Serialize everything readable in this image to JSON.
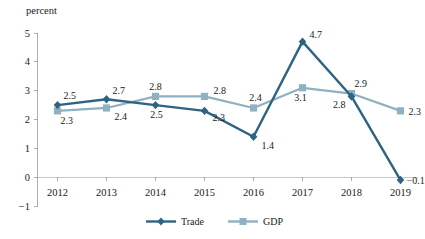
{
  "chart_data": {
    "type": "line",
    "title": "",
    "xlabel": "",
    "ylabel": "percent",
    "ylim": [
      -1,
      5
    ],
    "yticks": [
      "5",
      "4",
      "3",
      "2",
      "1",
      "0",
      "−1"
    ],
    "grid": false,
    "legend_position": "bottom",
    "categories": [
      "2012",
      "2013",
      "2014",
      "2015",
      "2016",
      "2017",
      "2018",
      "2019"
    ],
    "series": [
      {
        "name": "Trade",
        "color": "#2e6382",
        "marker": "diamond",
        "values": [
          2.5,
          2.7,
          2.5,
          2.3,
          1.4,
          4.7,
          2.8,
          -0.1
        ],
        "labels": [
          "2.5",
          "2.7",
          "2.5",
          "2.3",
          "1.4",
          "4.7",
          "2.8",
          "−0.1"
        ]
      },
      {
        "name": "GDP",
        "color": "#8fb1c2",
        "marker": "square",
        "values": [
          2.3,
          2.4,
          2.8,
          2.8,
          2.4,
          3.1,
          2.9,
          2.3
        ],
        "labels": [
          "2.3",
          "2.4",
          "2.8",
          "2.8",
          "2.4",
          "3.1",
          "2.9",
          "2.3"
        ]
      }
    ]
  },
  "axis": {
    "unit_label": "percent"
  },
  "legend": {
    "items": [
      {
        "label": "Trade"
      },
      {
        "label": "GDP"
      }
    ]
  }
}
